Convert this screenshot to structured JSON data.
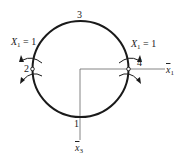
{
  "diagram": {
    "type": "ring structure with hinges (structural mechanics)",
    "points": {
      "p1": "1",
      "p2": "2",
      "p3": "3",
      "p4": "4"
    },
    "loads": {
      "left": {
        "var": "X",
        "sub": "1",
        "eq": " = 1"
      },
      "right": {
        "var": "X",
        "sub": "1",
        "eq": " = 1"
      }
    },
    "axes": {
      "horizontal": {
        "var": "x",
        "sub": "1"
      },
      "vertical": {
        "var": "x",
        "sub": "3"
      }
    },
    "colors": {
      "stroke": "#1a1a1a",
      "axis": "#555555",
      "background": "#ffffff"
    }
  }
}
